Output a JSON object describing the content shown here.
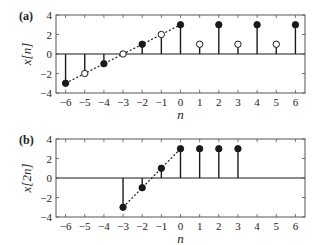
{
  "chart_data": [
    {
      "panel": "(a)",
      "type": "stem",
      "title": "",
      "xlabel": "n",
      "ylabel": "x[n]",
      "xlim": [
        -6.5,
        6.5
      ],
      "ylim": [
        -4,
        4
      ],
      "xticks": [
        -6,
        -5,
        -4,
        -3,
        -2,
        -1,
        0,
        1,
        2,
        3,
        4,
        5,
        6
      ],
      "yticks": [
        -4,
        -2,
        0,
        2,
        4
      ],
      "x": [
        -6,
        -5,
        -4,
        -3,
        -2,
        -1,
        0,
        1,
        2,
        3,
        4,
        5,
        6
      ],
      "values": [
        -3,
        -2,
        -1,
        0,
        1,
        2,
        3,
        1,
        3,
        1,
        3,
        1,
        3
      ],
      "marker_filled": [
        true,
        false,
        true,
        false,
        true,
        false,
        true,
        false,
        true,
        false,
        true,
        false,
        true
      ],
      "dotted_line": {
        "from": [
          -6,
          -3
        ],
        "to": [
          0,
          3
        ]
      },
      "grid": false
    },
    {
      "panel": "(b)",
      "type": "stem",
      "title": "",
      "xlabel": "n",
      "ylabel": "x[2n]",
      "xlim": [
        -6.5,
        6.5
      ],
      "ylim": [
        -4,
        4
      ],
      "xticks": [
        -6,
        -5,
        -4,
        -3,
        -2,
        -1,
        0,
        1,
        2,
        3,
        4,
        5,
        6
      ],
      "yticks": [
        -4,
        -2,
        0,
        2,
        4
      ],
      "x": [
        -3,
        -2,
        -1,
        0,
        1,
        2,
        3
      ],
      "values": [
        -3,
        -1,
        1,
        3,
        3,
        3,
        3
      ],
      "marker_filled": [
        true,
        true,
        true,
        true,
        true,
        true,
        true
      ],
      "dotted_line": {
        "from": [
          -3,
          -3
        ],
        "to": [
          0,
          3
        ]
      },
      "grid": false
    }
  ],
  "colors": {
    "stem": "#1a1a1a",
    "axis": "#555555",
    "background": "#ffffff"
  }
}
